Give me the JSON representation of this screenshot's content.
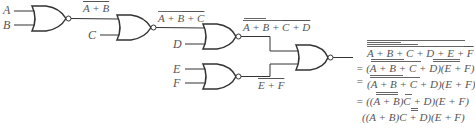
{
  "diagram": {
    "type": "logic-circuit",
    "inputs": [
      "A",
      "B",
      "C",
      "D",
      "E",
      "F"
    ],
    "gates": [
      {
        "id": "g1",
        "type": "NOR",
        "inputs": [
          "A",
          "B"
        ],
        "output_label": "A + B"
      },
      {
        "id": "g2",
        "type": "NOR",
        "inputs": [
          "g1",
          "C"
        ],
        "output_label": "A + B + C"
      },
      {
        "id": "g3",
        "type": "NOR",
        "inputs": [
          "g2",
          "D"
        ],
        "output_label": "A + B + C + D"
      },
      {
        "id": "g5",
        "type": "NOR",
        "inputs": [
          "E",
          "F"
        ],
        "output_label": "E + F"
      },
      {
        "id": "g4",
        "type": "NOR",
        "inputs": [
          "g3",
          "g5"
        ],
        "output_label": "final"
      }
    ],
    "labels": {
      "A": "A",
      "B": "B",
      "C": "C",
      "D": "D",
      "E": "E",
      "F": "F",
      "g1_out": "A + B",
      "g2_out": "A + B + C",
      "g3_out": "A + B + C + D",
      "g5_out": "E + F"
    },
    "equations": [
      "A + B + C + D + E + F",
      "= (A + B + C + D)(E + F)",
      "= (A + B + C + D)(E + F)",
      "= ((A + B)C + D)(E + F)",
      "((A + B)C + D)(E + F)"
    ],
    "equations_text": {
      "l1": "A + B + C + D + E + F",
      "l2": "= (A + B + C + D)(E + F)",
      "l3_eq": "=",
      "l3": "(A + B + C + D)(E + F)",
      "l4": "= ((A + B)C + D)(E + F)",
      "l5": "((A + B)C + D)(E + F)"
    },
    "colors": {
      "stroke": "#333333",
      "text": "#555555",
      "background": "#ffffff"
    }
  }
}
